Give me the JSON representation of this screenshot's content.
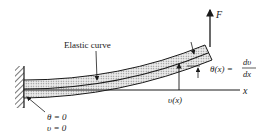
{
  "diagram": {
    "labels": {
      "force": "F",
      "elastic_curve": "Elastic curve",
      "x_axis": "x",
      "deflection": "υ(x)",
      "slope_lhs": "θ(x) =",
      "slope_num": "dυ",
      "slope_den": "dx",
      "bc_theta": "θ = 0",
      "bc_v": "υ = 0"
    },
    "colors": {
      "ink": "#1a1a1a",
      "beam_fill": "#d8d8d8",
      "background": "#ffffff"
    }
  }
}
